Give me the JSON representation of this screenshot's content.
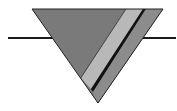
{
  "diagram": {
    "type": "symbol",
    "colors": {
      "background": "#ffffff",
      "line": "#1a1a1a",
      "triangle_main": "#7a7a7a",
      "stripe_light": "#b8b8b8",
      "stripe_dark_line": "#111111",
      "stripe_medium": "#8c8c8c",
      "outline": "#222222"
    }
  }
}
